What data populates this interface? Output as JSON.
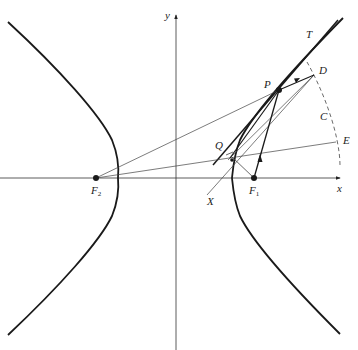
{
  "diagram": {
    "type": "hyperbola-reflection-property",
    "axes": {
      "x_label": "x",
      "y_label": "y"
    },
    "points": {
      "P": "P",
      "Q": "Q",
      "D": "D",
      "C": "C",
      "E": "E",
      "T": "T",
      "X": "X",
      "F1": {
        "main": "F",
        "sub": "1"
      },
      "F2": {
        "main": "F",
        "sub": "2"
      }
    },
    "colors": {
      "stroke": "#1a1a1a",
      "thin": "#333333",
      "background": "#ffffff"
    }
  }
}
